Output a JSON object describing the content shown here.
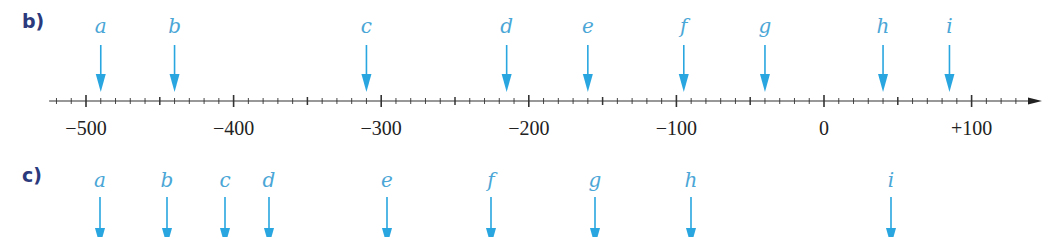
{
  "colors": {
    "part_label": "#2b3a7c",
    "letter": "#4aa6d6",
    "arrow": "#29a6e0",
    "axis": "#333333",
    "tick_label": "#222222"
  },
  "parts": [
    {
      "label": "b)",
      "has_axis": true,
      "letters": [
        "a",
        "b",
        "c",
        "d",
        "e",
        "f",
        "g",
        "h",
        "i"
      ]
    },
    {
      "label": "c)",
      "has_axis": false,
      "letters": [
        "a",
        "b",
        "c",
        "d",
        "e",
        "f",
        "g",
        "h",
        "i"
      ]
    }
  ],
  "chart_data": [
    {
      "type": "number-line",
      "title": "b)",
      "axis": {
        "range": [
          -525,
          135
        ],
        "minor_tick_step": 10,
        "mid_tick_step": 50,
        "major_tick_step": 100,
        "labeled_ticks": [
          -500,
          -400,
          -300,
          -200,
          -100,
          0,
          100
        ],
        "tick_labels": [
          "−500",
          "−400",
          "−300",
          "−200",
          "−100",
          "0",
          "+100"
        ],
        "arrow_direction": "right"
      },
      "points": [
        {
          "label": "a",
          "value": -490
        },
        {
          "label": "b",
          "value": -440
        },
        {
          "label": "c",
          "value": -310
        },
        {
          "label": "d",
          "value": -215
        },
        {
          "label": "e",
          "value": -160
        },
        {
          "label": "f",
          "value": -95
        },
        {
          "label": "g",
          "value": -40
        },
        {
          "label": "h",
          "value": 40
        },
        {
          "label": "i",
          "value": 85
        }
      ]
    },
    {
      "type": "number-line",
      "title": "c)",
      "axis": null,
      "points_x_px": [
        {
          "label": "a",
          "x": 100
        },
        {
          "label": "b",
          "x": 167
        },
        {
          "label": "c",
          "x": 225
        },
        {
          "label": "d",
          "x": 269
        },
        {
          "label": "e",
          "x": 387
        },
        {
          "label": "f",
          "x": 491
        },
        {
          "label": "g",
          "x": 595
        },
        {
          "label": "h",
          "x": 691
        },
        {
          "label": "i",
          "x": 891
        }
      ]
    }
  ]
}
